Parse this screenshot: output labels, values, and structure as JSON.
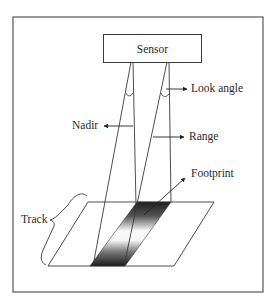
{
  "diagram": {
    "type": "remote-sensing-geometry",
    "sensor_label": "Sensor",
    "labels": {
      "look_angle": "Look angle",
      "nadir": "Nadir",
      "range": "Range",
      "footprint": "Footprint",
      "track": "Track"
    },
    "colors": {
      "stroke": "#3a3a3a",
      "frame": "#555555",
      "footprint_dark": "#1e1e1e",
      "background": "#ffffff"
    }
  }
}
